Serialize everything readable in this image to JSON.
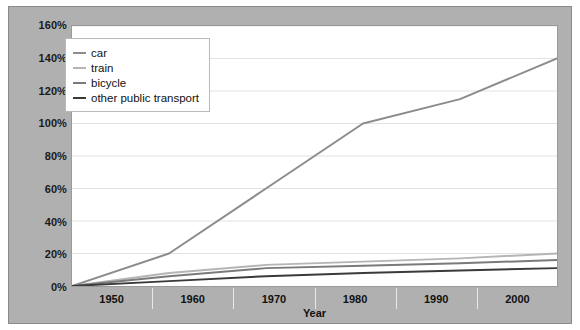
{
  "chart_data": {
    "type": "line",
    "title": "",
    "xlabel": "Year",
    "ylabel": "",
    "x": [
      1950,
      1960,
      1970,
      1980,
      1990,
      2000
    ],
    "xtick_labels": [
      "1950",
      "1960",
      "1970",
      "1980",
      "1990",
      "2000"
    ],
    "ytick_labels": [
      "0%",
      "20%",
      "40%",
      "60%",
      "80%",
      "100%",
      "120%",
      "140%",
      "160%"
    ],
    "ytick_values": [
      0,
      20,
      40,
      60,
      80,
      100,
      120,
      140,
      160
    ],
    "ylim": [
      0,
      160
    ],
    "grid": true,
    "legend_position": "top-left",
    "series": [
      {
        "name": "car",
        "color": "#8c8c8c",
        "values": [
          0,
          20,
          60,
          100,
          115,
          140
        ]
      },
      {
        "name": "train",
        "color": "#b5b5b5",
        "values": [
          0,
          8,
          13,
          15,
          17,
          20
        ]
      },
      {
        "name": "bicycle",
        "color": "#7a7a7a",
        "values": [
          0,
          6,
          11,
          12.5,
          14,
          16
        ]
      },
      {
        "name": "other public transport",
        "color": "#3a3a3a",
        "values": [
          0,
          3,
          6,
          8,
          9.5,
          11
        ]
      }
    ]
  },
  "legend": {
    "items": [
      {
        "label": "car"
      },
      {
        "label": "train"
      },
      {
        "label": "bicycle"
      },
      {
        "label": "other public transport"
      }
    ]
  }
}
